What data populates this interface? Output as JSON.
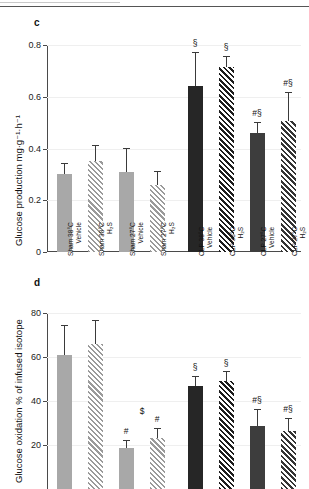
{
  "figure": {
    "top_rule": "horizontal-rule",
    "panels": [
      {
        "letter": "c",
        "ylabel": "Glucose production mg·g⁻¹·h⁻¹"
      },
      {
        "letter": "d",
        "ylabel": "Glucose oxidation % of infused isotope"
      }
    ]
  },
  "chart_data": [
    {
      "type": "bar",
      "panel": "c",
      "title": "",
      "xlabel": "",
      "ylabel": "Glucose production mg·g⁻¹·h⁻¹",
      "ylim": [
        0,
        0.8
      ],
      "yticks": [
        0,
        0.2,
        0.4,
        0.6,
        0.8
      ],
      "ytick_labels": [
        "0",
        "0.2",
        "0.4",
        "0.6",
        "0.8"
      ],
      "grid": true,
      "legend": "none",
      "categories": [
        "Sham 38°C Vehicle",
        "Sham 38°C H₂S",
        "Sham 27°C Vehicle",
        "Sham 27°C H₂S",
        "CLP 38°C Vehicle",
        "CLP 38°C H₂S",
        "CLP 27°C Vehicle",
        "CLP 27°C H₂S"
      ],
      "category_lines": [
        [
          "Sham 38°C",
          "Vehicle"
        ],
        [
          "Sham 38°C",
          "H₂S"
        ],
        [
          "Sham 27°C",
          "Vehicle"
        ],
        [
          "Sham 27°C",
          "H₂S"
        ],
        [
          "CLP 38°C",
          "Vehicle"
        ],
        [
          "CLP 38°C",
          "H₂S"
        ],
        [
          "CLP 27°C",
          "Vehicle"
        ],
        [
          "CLP 27°C",
          "H₂S"
        ]
      ],
      "values": [
        0.3,
        0.35,
        0.31,
        0.26,
        0.64,
        0.715,
        0.46,
        0.505
      ],
      "err_upper": [
        0.04,
        0.06,
        0.09,
        0.05,
        0.13,
        0.04,
        0.04,
        0.11
      ],
      "annotations": [
        "",
        "",
        "",
        "",
        "§",
        "§",
        "#§",
        "#§"
      ],
      "bar_styles": [
        "solid-light",
        "hatch-light",
        "solid-light",
        "hatch-light",
        "solid-dark",
        "hatch-dark",
        "solid-mid",
        "hatch-mid"
      ]
    },
    {
      "type": "bar",
      "panel": "d",
      "title": "",
      "xlabel": "",
      "ylabel": "Glucose oxidation % of infused isotope",
      "ylim": [
        0,
        80
      ],
      "yticks": [
        20,
        40,
        60,
        80
      ],
      "ytick_labels": [
        "20",
        "40",
        "60",
        "80"
      ],
      "grid": true,
      "legend": "none",
      "categories": [
        "Sham 38°C Vehicle",
        "Sham 38°C H₂S",
        "Sham 27°C Vehicle",
        "Sham 27°C H₂S",
        "CLP 38°C Vehicle",
        "CLP 38°C H₂S",
        "CLP 27°C Vehicle",
        "CLP 27°C H₂S"
      ],
      "values": [
        61,
        66,
        18.5,
        23,
        47,
        49,
        28.5,
        26.5
      ],
      "err_upper": [
        13,
        10.5,
        3.5,
        4.5,
        4,
        4,
        7.5,
        5.5
      ],
      "annotations": [
        "",
        "",
        "#",
        "#",
        "§",
        "§",
        "#§",
        "#§"
      ],
      "extra_annotations": [
        {
          "label": "$",
          "near_category": "Sham 27°C H₂S"
        }
      ],
      "bar_styles": [
        "solid-light",
        "hatch-light",
        "solid-light",
        "hatch-light",
        "solid-dark",
        "hatch-dark",
        "solid-mid",
        "hatch-mid"
      ],
      "note": "panel cropped at bottom of screenshot near y=20"
    }
  ],
  "colors": {
    "sham_light": "#a8a8a8",
    "clp_38": "#262626",
    "clp_27": "#3d3d3d",
    "axis": "#4a4a4a",
    "grid": "#efefef"
  }
}
